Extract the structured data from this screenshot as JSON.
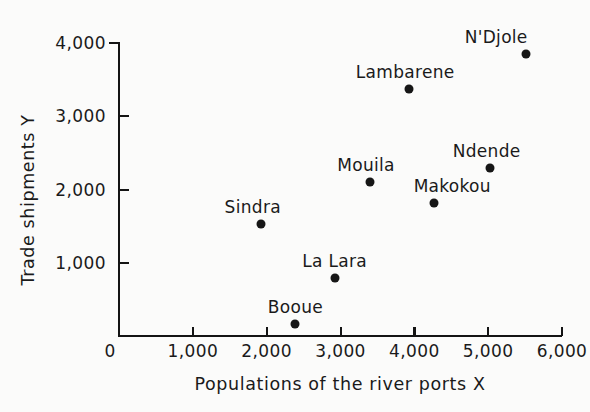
{
  "chart_data": {
    "type": "scatter",
    "title": "",
    "xlabel": "Populations of the river ports X",
    "ylabel": "Trade shipments Y",
    "xlim": [
      0,
      6000
    ],
    "ylim": [
      0,
      4000
    ],
    "grid": false,
    "legend": "none",
    "x_ticks": [
      {
        "value": 0,
        "label": "0"
      },
      {
        "value": 1000,
        "label": "1,000"
      },
      {
        "value": 2000,
        "label": "2,000"
      },
      {
        "value": 3000,
        "label": "3,000"
      },
      {
        "value": 4000,
        "label": "4,000"
      },
      {
        "value": 5000,
        "label": "5,000"
      },
      {
        "value": 6000,
        "label": "6,000"
      }
    ],
    "y_ticks": [
      {
        "value": 1000,
        "label": "1,000"
      },
      {
        "value": 2000,
        "label": "2,000"
      },
      {
        "value": 3000,
        "label": "3,000"
      },
      {
        "value": 4000,
        "label": "4,000"
      }
    ],
    "points": [
      {
        "name": "Booue",
        "x": 2390,
        "y": 160,
        "label_dx": 0,
        "label_dy": 215
      },
      {
        "name": "La Lara",
        "x": 2920,
        "y": 790,
        "label_dx": 0,
        "label_dy": 210
      },
      {
        "name": "Sindra",
        "x": 1920,
        "y": 1530,
        "label_dx": -8,
        "label_dy": 225
      },
      {
        "name": "Makokou",
        "x": 4270,
        "y": 1810,
        "label_dx": 18,
        "label_dy": 185
      },
      {
        "name": "Mouila",
        "x": 3400,
        "y": 2100,
        "label_dx": -4,
        "label_dy": 235
      },
      {
        "name": "Ndende",
        "x": 5020,
        "y": 2290,
        "label_dx": -3,
        "label_dy": 250
      },
      {
        "name": "Lambarene",
        "x": 3930,
        "y": 3370,
        "label_dx": -4,
        "label_dy": 220
      },
      {
        "name": "N'Djole",
        "x": 5515,
        "y": 3855,
        "label_dx": -30,
        "label_dy": 275
      }
    ]
  },
  "colors": {
    "marker": "#161616",
    "axis": "#141414",
    "text": "#1a1a1a",
    "background": "#fbfbfa"
  }
}
